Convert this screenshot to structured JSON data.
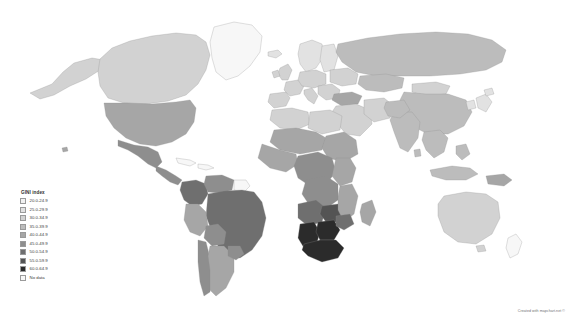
{
  "figure": {
    "background_color": "#ffffff",
    "attribution": "Created with mapchart.net ©"
  },
  "legend": {
    "title": "GINI index",
    "position": "bottom-left",
    "entries": [
      {
        "label": "20.0-24.9",
        "color": "#f2f2f2"
      },
      {
        "label": "25.0-29.9",
        "color": "#e2e2e2"
      },
      {
        "label": "30.0-34.9",
        "color": "#d2d2d2"
      },
      {
        "label": "35.0-39.9",
        "color": "#bcbcbc"
      },
      {
        "label": "40.0-44.9",
        "color": "#a6a6a6"
      },
      {
        "label": "45.0-49.9",
        "color": "#8e8e8e"
      },
      {
        "label": "50.0-54.9",
        "color": "#6f6f6f"
      },
      {
        "label": "55.0-59.9",
        "color": "#545454"
      },
      {
        "label": "60.0-64.9",
        "color": "#2b2b2b"
      },
      {
        "label": "No data",
        "color": "#f7f7f7"
      }
    ]
  },
  "chart_data": {
    "type": "map",
    "title": "GINI index",
    "subtitle": "",
    "projection": "equirectangular-world",
    "measure": "GINI index",
    "color_scheme": "grayscale sequential, light = low inequality, dark = high inequality",
    "legend_position": "bottom-left",
    "bins": [
      {
        "range": "20.0-24.9",
        "min": 20.0,
        "max": 24.9,
        "color": "#f2f2f2"
      },
      {
        "range": "25.0-29.9",
        "min": 25.0,
        "max": 29.9,
        "color": "#e2e2e2"
      },
      {
        "range": "30.0-34.9",
        "min": 30.0,
        "max": 34.9,
        "color": "#d2d2d2"
      },
      {
        "range": "35.0-39.9",
        "min": 35.0,
        "max": 39.9,
        "color": "#bcbcbc"
      },
      {
        "range": "40.0-44.9",
        "min": 40.0,
        "max": 44.9,
        "color": "#a6a6a6"
      },
      {
        "range": "45.0-49.9",
        "min": 45.0,
        "max": 49.9,
        "color": "#8e8e8e"
      },
      {
        "range": "50.0-54.9",
        "min": 50.0,
        "max": 54.9,
        "color": "#6f6f6f"
      },
      {
        "range": "55.0-59.9",
        "min": 55.0,
        "max": 59.9,
        "color": "#545454"
      },
      {
        "range": "60.0-64.9",
        "min": 60.0,
        "max": 64.9,
        "color": "#2b2b2b"
      },
      {
        "range": "No data",
        "min": null,
        "max": null,
        "color": "#f7f7f7"
      }
    ],
    "regions": [
      {
        "name": "Canada",
        "bin": "30.0-34.9",
        "color": "#d2d2d2"
      },
      {
        "name": "United States",
        "bin": "40.0-44.9",
        "color": "#a6a6a6"
      },
      {
        "name": "Greenland",
        "bin": "No data",
        "color": "#f7f7f7"
      },
      {
        "name": "Mexico",
        "bin": "45.0-49.9",
        "color": "#8e8e8e"
      },
      {
        "name": "Central America",
        "bin": "45.0-49.9",
        "color": "#8e8e8e"
      },
      {
        "name": "Colombia",
        "bin": "50.0-54.9",
        "color": "#6f6f6f"
      },
      {
        "name": "Venezuela",
        "bin": "45.0-49.9",
        "color": "#8e8e8e"
      },
      {
        "name": "Brazil",
        "bin": "50.0-54.9",
        "color": "#6f6f6f"
      },
      {
        "name": "Peru",
        "bin": "40.0-44.9",
        "color": "#a6a6a6"
      },
      {
        "name": "Bolivia",
        "bin": "45.0-49.9",
        "color": "#8e8e8e"
      },
      {
        "name": "Chile",
        "bin": "45.0-49.9",
        "color": "#8e8e8e"
      },
      {
        "name": "Argentina",
        "bin": "40.0-44.9",
        "color": "#a6a6a6"
      },
      {
        "name": "Western Europe",
        "bin": "30.0-34.9",
        "color": "#d2d2d2"
      },
      {
        "name": "Nordic countries",
        "bin": "25.0-29.9",
        "color": "#e2e2e2"
      },
      {
        "name": "Eastern Europe",
        "bin": "30.0-34.9",
        "color": "#d2d2d2"
      },
      {
        "name": "Russia",
        "bin": "35.0-39.9",
        "color": "#bcbcbc"
      },
      {
        "name": "Turkey",
        "bin": "40.0-44.9",
        "color": "#a6a6a6"
      },
      {
        "name": "North Africa",
        "bin": "30.0-34.9",
        "color": "#d2d2d2"
      },
      {
        "name": "West Africa",
        "bin": "40.0-44.9",
        "color": "#a6a6a6"
      },
      {
        "name": "Central Africa",
        "bin": "45.0-49.9",
        "color": "#8e8e8e"
      },
      {
        "name": "Angola",
        "bin": "50.0-54.9",
        "color": "#6f6f6f"
      },
      {
        "name": "Zambia",
        "bin": "55.0-59.9",
        "color": "#545454"
      },
      {
        "name": "Botswana",
        "bin": "60.0-64.9",
        "color": "#2b2b2b"
      },
      {
        "name": "Namibia",
        "bin": "60.0-64.9",
        "color": "#2b2b2b"
      },
      {
        "name": "South Africa",
        "bin": "60.0-64.9",
        "color": "#2b2b2b"
      },
      {
        "name": "Madagascar",
        "bin": "40.0-44.9",
        "color": "#a6a6a6"
      },
      {
        "name": "Middle East",
        "bin": "30.0-34.9",
        "color": "#d2d2d2"
      },
      {
        "name": "India",
        "bin": "35.0-39.9",
        "color": "#bcbcbc"
      },
      {
        "name": "China",
        "bin": "35.0-39.9",
        "color": "#bcbcbc"
      },
      {
        "name": "Mongolia",
        "bin": "30.0-34.9",
        "color": "#d2d2d2"
      },
      {
        "name": "Southeast Asia",
        "bin": "35.0-39.9",
        "color": "#bcbcbc"
      },
      {
        "name": "Indonesia",
        "bin": "35.0-39.9",
        "color": "#bcbcbc"
      },
      {
        "name": "Australia",
        "bin": "30.0-34.9",
        "color": "#d2d2d2"
      },
      {
        "name": "New Zealand",
        "bin": "No data",
        "color": "#f7f7f7"
      },
      {
        "name": "Papua New Guinea",
        "bin": "40.0-44.9",
        "color": "#a6a6a6"
      }
    ]
  }
}
